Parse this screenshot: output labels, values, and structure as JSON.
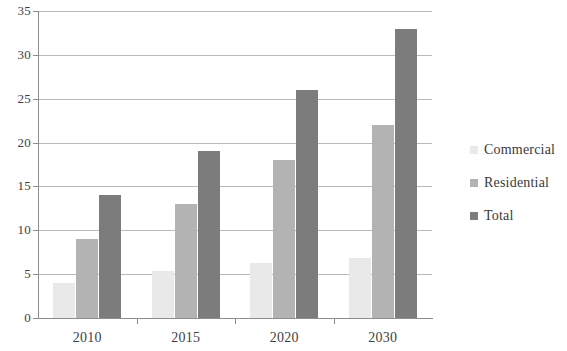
{
  "chart_data": {
    "type": "bar",
    "title": "",
    "subtitle": "",
    "xlabel": "",
    "ylabel": "",
    "categories": [
      "2010",
      "2015",
      "2020",
      "2030"
    ],
    "series": [
      {
        "name": "Commercial",
        "color": "#e9e9e9",
        "values": [
          4,
          5.4,
          6.3,
          6.8
        ]
      },
      {
        "name": "Residential",
        "color": "#b3b3b3",
        "values": [
          9,
          13,
          18,
          22
        ]
      },
      {
        "name": "Total",
        "color": "#7c7c7c",
        "values": [
          14,
          19,
          26,
          33
        ]
      }
    ],
    "ylim": [
      0,
      35
    ],
    "yticks": [
      0,
      5,
      10,
      15,
      20,
      25,
      30,
      35
    ],
    "ytick_labels": [
      "0",
      "5",
      "10",
      "15",
      "20",
      "25",
      "30",
      "35"
    ],
    "grid": true,
    "legend_position": "right"
  }
}
